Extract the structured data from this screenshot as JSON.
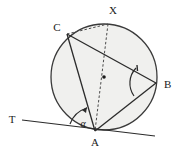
{
  "figure": {
    "background_color": "#ffffff",
    "stroke_color": "#2b2b2b",
    "circle_fill": "#f0f0ee"
  },
  "circle": {
    "name": "main-circle",
    "cx": 104,
    "cy": 77,
    "r": 53,
    "fill": "#f0f0ee",
    "stroke": "#3a3a3a",
    "stroke_width": 1.3
  },
  "center_dot": {
    "name": "circle-center-point",
    "cx": 104,
    "cy": 77,
    "r": 1.8,
    "fill": "#1a1a1a"
  },
  "points": [
    {
      "id": "A",
      "label": "A",
      "x": 95,
      "y": 131,
      "label_x": 95,
      "label_y": 145
    },
    {
      "id": "B",
      "label": "B",
      "x": 156,
      "y": 83,
      "label_x": 166,
      "label_y": 88
    },
    {
      "id": "C",
      "label": "C",
      "x": 67,
      "y": 34,
      "label_x": 57,
      "label_y": 30
    },
    {
      "id": "X",
      "label": "X",
      "x": 108,
      "y": 24,
      "label_x": 112,
      "label_y": 13
    },
    {
      "id": "T",
      "label": "T",
      "x": 22,
      "y": 120,
      "label_x": 12,
      "label_y": 122
    }
  ],
  "segments": [
    {
      "name": "chord-C-A",
      "from": "C",
      "to": "A",
      "x1": 67,
      "y1": 34,
      "x2": 95,
      "y2": 131,
      "style": "solid"
    },
    {
      "name": "chord-C-B",
      "from": "C",
      "to": "B",
      "x1": 67,
      "y1": 34,
      "x2": 156,
      "y2": 83,
      "style": "solid"
    },
    {
      "name": "chord-A-B",
      "from": "A",
      "to": "B",
      "x1": 95,
      "y1": 131,
      "x2": 156,
      "y2": 83,
      "style": "solid"
    },
    {
      "name": "tangent-line-T-A",
      "from": "T",
      "to": "tangent-end",
      "x1": 22,
      "y1": 120,
      "x2": 155,
      "y2": 136,
      "style": "solid"
    }
  ],
  "dashed_segments": [
    {
      "name": "dashed-chord-C-X",
      "from": "C",
      "to": "X",
      "x1": 67,
      "y1": 34,
      "x2": 108,
      "y2": 24
    },
    {
      "name": "dashed-diameter-X-A",
      "from": "X",
      "to": "A",
      "x1": 108,
      "y1": 24,
      "x2": 95,
      "y2": 131
    }
  ],
  "angles": [
    {
      "name": "angle-alpha-at-A",
      "label": "α",
      "vertex": "A",
      "label_x": 84,
      "label_y": 126,
      "arc_path": "M 70 124 A 26 26 0 0 1 86 107",
      "arrow_tip_x": 86,
      "arrow_tip_y": 107,
      "description": "tangent-chord angle between tangent TA and chord AC"
    },
    {
      "name": "angle-at-B",
      "label": "",
      "vertex": "B",
      "arc_path": "M 136 68 A 22 22 0 0 0 134 96",
      "tick_x1": 137,
      "tick_y1": 66,
      "tick_x2": 138,
      "tick_y2": 71,
      "description": "inscribed angle ABC subtending chord AC"
    }
  ],
  "labels": {
    "point_a": "A",
    "point_b": "B",
    "point_c": "C",
    "point_x": "X",
    "point_t": "T",
    "alpha": "α"
  }
}
